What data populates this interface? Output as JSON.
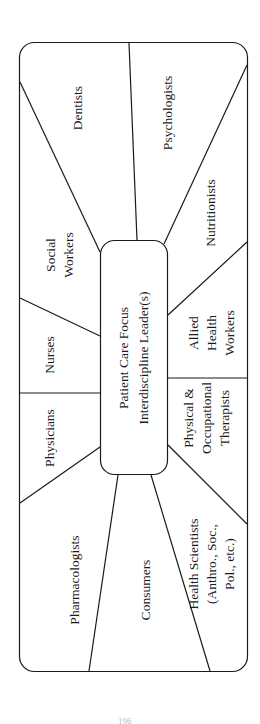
{
  "diagram": {
    "center": {
      "lines": [
        "Patient Care Focus",
        "Interdiscipline Leader(s)"
      ]
    },
    "segments": [
      {
        "id": "dentists",
        "lines": [
          "Dentists"
        ]
      },
      {
        "id": "psychologists",
        "lines": [
          "Psychologists"
        ]
      },
      {
        "id": "social-workers",
        "lines": [
          "Social",
          "Workers"
        ]
      },
      {
        "id": "nutritionists",
        "lines": [
          "Nutritionists"
        ]
      },
      {
        "id": "nurses",
        "lines": [
          "Nurses"
        ]
      },
      {
        "id": "allied-health-workers",
        "lines": [
          "Allied",
          "Health",
          "Workers"
        ]
      },
      {
        "id": "physicians",
        "lines": [
          "Physicians"
        ]
      },
      {
        "id": "physical-occupational-therapists",
        "lines": [
          "Physical &",
          "Occupational",
          "Therapists"
        ]
      },
      {
        "id": "pharmacologists",
        "lines": [
          "Pharmacologists"
        ]
      },
      {
        "id": "consumers",
        "lines": [
          "Consumers"
        ]
      },
      {
        "id": "health-scientists",
        "lines": [
          "Health Scientists",
          "(Anthro., Soc.,",
          "Pol., etc.)"
        ]
      }
    ],
    "colors": {
      "stroke": "#1a1a1a",
      "text": "#1a1a1a",
      "background": "#ffffff"
    }
  },
  "page": {
    "number": "196"
  }
}
